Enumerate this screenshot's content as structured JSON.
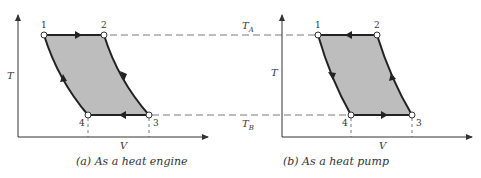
{
  "diagrams": [
    {
      "id": "a",
      "caption": "(a)  As a heat engine",
      "axis_x_label": "V",
      "axis_y_label": "T",
      "points": [
        {
          "label": "1"
        },
        {
          "label": "2"
        },
        {
          "label": "3"
        },
        {
          "label": "4"
        }
      ],
      "cycle_direction": "clockwise",
      "fill_color": "#bdbdbd"
    },
    {
      "id": "b",
      "caption": "(b)  As a heat pump",
      "axis_x_label": "V",
      "axis_y_label": "T",
      "points": [
        {
          "label": "1"
        },
        {
          "label": "2"
        },
        {
          "label": "3"
        },
        {
          "label": "4"
        }
      ],
      "cycle_direction": "counterclockwise",
      "fill_color": "#bdbdbd"
    }
  ],
  "reservoirs": {
    "hot": {
      "symbol": "T",
      "subscript": "A"
    },
    "cold": {
      "symbol": "T",
      "subscript": "B"
    }
  }
}
